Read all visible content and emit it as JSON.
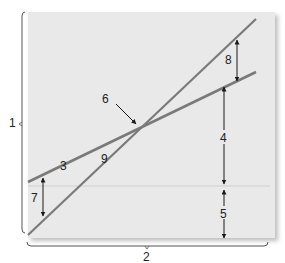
{
  "diagram": {
    "axis_labels": {
      "y": "1",
      "x": "2"
    },
    "callouts": {
      "revenue_line": "3",
      "gap_upper": "4",
      "gap_lower": "5",
      "intersection": "6",
      "left_gap": "7",
      "right_gap": "8",
      "cost_line": "9"
    },
    "colors": {
      "panel": "#e9e9e9",
      "line": "#7a7a7a",
      "baseline": "#cfcfcf",
      "arrow": "#1a1a1a",
      "bracket": "#555555"
    }
  }
}
